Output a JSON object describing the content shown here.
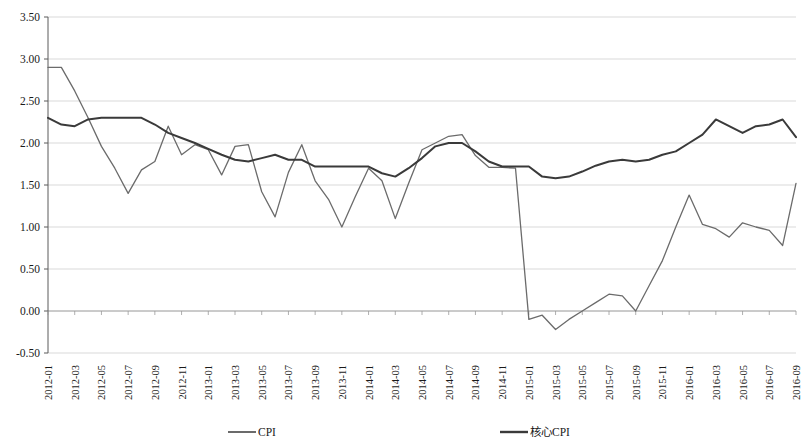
{
  "chart_data": {
    "type": "line",
    "title": "",
    "subtitle": "",
    "xlabel": "",
    "ylabel": "",
    "grid": true,
    "legend_position": "bottom",
    "ylim": [
      -0.5,
      3.5
    ],
    "ytick_labels": [
      "3.50",
      "3.00",
      "2.50",
      "2.00",
      "1.50",
      "1.00",
      "0.50",
      "0.00",
      "-0.50"
    ],
    "ytick_values": [
      3.5,
      3.0,
      2.5,
      2.0,
      1.5,
      1.0,
      0.5,
      0.0,
      -0.5
    ],
    "x": [
      "2012-01",
      "2012-02",
      "2012-03",
      "2012-04",
      "2012-05",
      "2012-06",
      "2012-07",
      "2012-08",
      "2012-09",
      "2012-10",
      "2012-11",
      "2012-12",
      "2013-01",
      "2013-02",
      "2013-03",
      "2013-04",
      "2013-05",
      "2013-06",
      "2013-07",
      "2013-08",
      "2013-09",
      "2013-10",
      "2013-11",
      "2013-12",
      "2014-01",
      "2014-02",
      "2014-03",
      "2014-04",
      "2014-05",
      "2014-06",
      "2014-07",
      "2014-08",
      "2014-09",
      "2014-10",
      "2014-11",
      "2014-12",
      "2015-01",
      "2015-02",
      "2015-03",
      "2015-04",
      "2015-05",
      "2015-06",
      "2015-07",
      "2015-08",
      "2015-09",
      "2015-10",
      "2015-11",
      "2015-12",
      "2016-01",
      "2016-02",
      "2016-03",
      "2016-04",
      "2016-05",
      "2016-06",
      "2016-07",
      "2016-08",
      "2016-09"
    ],
    "xtick_labels": [
      "2012-01",
      "2012-03",
      "2012-05",
      "2012-07",
      "2012-09",
      "2012-11",
      "2013-01",
      "2013-03",
      "2013-05",
      "2013-07",
      "2013-09",
      "2013-11",
      "2014-01",
      "2014-03",
      "2014-05",
      "2014-07",
      "2014-09",
      "2014-11",
      "2015-01",
      "2015-03",
      "2015-05",
      "2015-07",
      "2015-09",
      "2015-11",
      "2016-01",
      "2016-03",
      "2016-05",
      "2016-07",
      "2016-09"
    ],
    "series": [
      {
        "name": "CPI",
        "color": "#6b6b6b",
        "values": [
          2.9,
          2.9,
          2.62,
          2.3,
          1.96,
          1.7,
          1.4,
          1.68,
          1.78,
          2.2,
          1.86,
          1.98,
          1.92,
          1.62,
          1.96,
          1.98,
          1.42,
          1.12,
          1.65,
          1.98,
          1.55,
          1.33,
          1.0,
          1.36,
          1.7,
          1.55,
          1.1,
          1.52,
          1.92,
          2.0,
          2.08,
          2.1,
          1.85,
          1.71,
          1.71,
          1.7,
          -0.1,
          -0.05,
          -0.22,
          -0.1,
          0.0,
          0.1,
          0.2,
          0.18,
          0.0,
          0.3,
          0.6,
          1.0,
          1.38,
          1.03,
          0.98,
          0.88,
          1.05,
          1.0,
          0.96,
          0.78,
          1.52
        ]
      },
      {
        "name": "核心CPI",
        "color": "#3a3a3a",
        "values": [
          2.3,
          2.22,
          2.2,
          2.28,
          2.3,
          2.3,
          2.3,
          2.3,
          2.22,
          2.12,
          2.06,
          2.0,
          1.93,
          1.86,
          1.8,
          1.78,
          1.82,
          1.86,
          1.8,
          1.8,
          1.72,
          1.72,
          1.72,
          1.72,
          1.72,
          1.64,
          1.6,
          1.7,
          1.82,
          1.96,
          2.0,
          2.0,
          1.9,
          1.78,
          1.72,
          1.72,
          1.72,
          1.6,
          1.58,
          1.6,
          1.66,
          1.73,
          1.78,
          1.8,
          1.78,
          1.8,
          1.86,
          1.9,
          2.0,
          2.1,
          2.28,
          2.2,
          2.12,
          2.2,
          2.22,
          2.28,
          2.07
        ]
      }
    ]
  },
  "legend": {
    "items": [
      {
        "label": "CPI",
        "color": "#6b6b6b"
      },
      {
        "label": "核心CPI",
        "color": "#3a3a3a"
      }
    ]
  }
}
